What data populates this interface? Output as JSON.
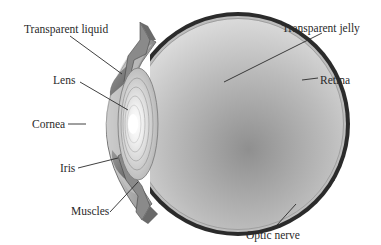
{
  "diagram": {
    "labels": {
      "transparent_liquid": "Transparent liquid",
      "lens": "Lens",
      "cornea": "Cornea",
      "iris": "Iris",
      "muscles": "Muscles",
      "transparent_jelly": "Transparent jelly",
      "retina": "Retina",
      "optic_nerve": "Optic nerve"
    },
    "colors": {
      "background": "#ffffff",
      "sclera_outer": "#2b2b2b",
      "retina_band": "#bdbdbd",
      "vitreous_light": "#e2e2e2",
      "vitreous_dark": "#8f8f8f",
      "cornea": "#a8a8a8",
      "aqueous": "#6e6e6e",
      "lens_glow": "#ffffff",
      "label_text": "#2a2a2a"
    }
  }
}
